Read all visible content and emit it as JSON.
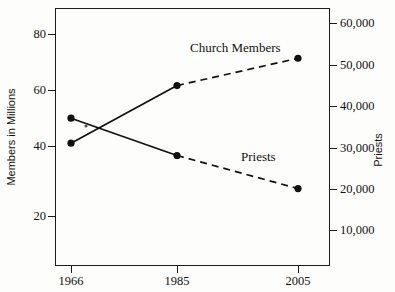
{
  "chart_data": {
    "type": "line",
    "title": "",
    "subtitle": "",
    "x": [
      1966,
      1985,
      2005
    ],
    "xtick_labels": [
      "1966",
      "1985",
      "2005"
    ],
    "xlabel": "",
    "ylabel": "Members in Millions",
    "ylabel_right": "Priests",
    "ylim": [
      0,
      90
    ],
    "ylim_right": [
      0,
      63000
    ],
    "ytick_labels_left": [
      "80",
      "60",
      "40",
      "20"
    ],
    "ytick_values_left": [
      80,
      60,
      40,
      20
    ],
    "ytick_labels_right": [
      "60,000",
      "50,000",
      "40,000",
      "30,000",
      "20,000",
      "10,000"
    ],
    "ytick_values_right": [
      60000,
      50000,
      40000,
      30000,
      20000,
      10000
    ],
    "grid": false,
    "legend_position": "inline-annotation",
    "series": [
      {
        "name": "Church Members",
        "axis": "left",
        "unit": "millions",
        "values": [
          44,
          63,
          72
        ],
        "marker": "filled-circle",
        "segment_styles": [
          "solid",
          "dashed"
        ],
        "annotation": "Church Members"
      },
      {
        "name": "Priests",
        "axis": "right",
        "unit": "count",
        "values": [
          37000,
          28000,
          20000
        ],
        "marker": "filled-circle",
        "segment_styles": [
          "solid",
          "dashed"
        ],
        "annotation": "Priests"
      }
    ],
    "colors": {
      "line": "#111111",
      "marker": "#111111",
      "axis": "#1a1a1a",
      "text": "#111111",
      "background": "#fdfdfc"
    }
  }
}
